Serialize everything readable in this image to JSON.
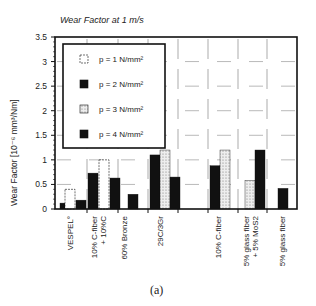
{
  "chart_data": {
    "type": "bar",
    "title": "Wear Factor at 1 m/s",
    "xlabel": "",
    "ylabel": "Wear Factor [10⁻⁶ mm³/Nm]",
    "ylim": [
      0,
      3.5
    ],
    "yticks": [
      "0",
      "0.5",
      "1",
      "1.5",
      "2",
      "2.5",
      "3",
      "3.5"
    ],
    "grid": "dashed",
    "legend_position": "top-left",
    "caption": "(a)",
    "categories": [
      [
        "VESPEL°"
      ],
      [
        "10% C-fiber",
        "+ 10%C"
      ],
      [
        "60% Bronze"
      ],
      [
        "29C/3Gr"
      ],
      [
        "10% C-fiber"
      ],
      [
        "5% glass fiber",
        "+ 5% MoS2"
      ],
      [
        "5% glass fiber"
      ]
    ],
    "series": [
      {
        "name": "p = 1 N/mm²",
        "style": "white",
        "values": [
          0.4,
          1.0,
          null,
          null,
          null,
          null,
          null
        ]
      },
      {
        "name": "p = 2 N/mm²",
        "style": "black",
        "values": [
          0.12,
          0.73,
          null,
          1.1,
          0.88,
          null,
          null
        ]
      },
      {
        "name": "p = 3 N/mm²",
        "style": "dotted",
        "values": [
          null,
          null,
          null,
          1.2,
          1.2,
          0.58,
          null
        ]
      },
      {
        "name": "p = 4 N/mm²",
        "style": "black",
        "values": [
          0.18,
          0.63,
          0.3,
          0.65,
          null,
          1.2,
          0.42
        ]
      }
    ],
    "colors": {
      "black": "#111111",
      "white": "#ffffff",
      "dotted": "#d8d8d8",
      "frame": "#111111"
    }
  }
}
